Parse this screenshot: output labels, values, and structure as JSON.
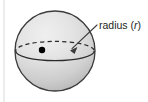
{
  "figure": {
    "label": {
      "text_main": "radius (",
      "text_var": "r",
      "text_close": ")",
      "full": "radius (r)"
    },
    "colors": {
      "background": "#ffffff",
      "sphere_light": "#e9e9e9",
      "sphere_mid": "#d6d6d6",
      "sphere_dark": "#bdbdbd",
      "outline": "#3b3b3b",
      "equator_line": "#2b2b2b",
      "center_dot": "#000000",
      "leader_line": "#3b3b3b",
      "text": "#231f20",
      "margin_rule": "#d9d9d9"
    },
    "geometry": {
      "sphere_center_x": 55,
      "sphere_center_y": 51,
      "sphere_radius": 40,
      "equator_semi_major": 40,
      "equator_semi_minor": 10,
      "center_dot_x": 42,
      "center_dot_y": 50,
      "center_dot_radius": 3.2,
      "arrow_tip_x": 70,
      "arrow_tip_y": 50,
      "leader_start_x": 97,
      "leader_start_y": 25
    }
  }
}
